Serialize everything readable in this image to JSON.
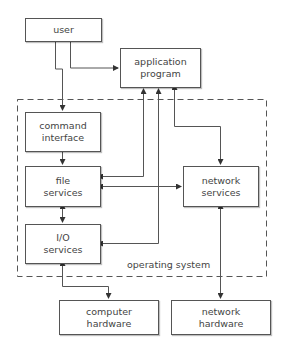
{
  "diagram": {
    "title": "",
    "boundary": {
      "label": "operating system"
    },
    "nodes": [
      {
        "id": "user",
        "label": "user"
      },
      {
        "id": "app",
        "label": "application\nprogram"
      },
      {
        "id": "cmd",
        "label": "command\ninterface"
      },
      {
        "id": "file",
        "label": "file\nservices"
      },
      {
        "id": "io",
        "label": "I/O\nservices"
      },
      {
        "id": "netsvc",
        "label": "network\nservices"
      },
      {
        "id": "comphw",
        "label": "computer\nhardware"
      },
      {
        "id": "nethw",
        "label": "network\nhardware"
      }
    ],
    "edges": [
      {
        "from": "user",
        "to": "app",
        "direction": "one-way"
      },
      {
        "from": "user",
        "to": "cmd",
        "direction": "one-way"
      },
      {
        "from": "cmd",
        "to": "file",
        "direction": "one-way"
      },
      {
        "from": "file",
        "to": "app",
        "direction": "two-way"
      },
      {
        "from": "io",
        "to": "app",
        "direction": "two-way"
      },
      {
        "from": "netsvc",
        "to": "app",
        "direction": "two-way"
      },
      {
        "from": "file",
        "to": "netsvc",
        "direction": "two-way"
      },
      {
        "from": "file",
        "to": "io",
        "direction": "two-way"
      },
      {
        "from": "io",
        "to": "comphw",
        "direction": "two-way"
      },
      {
        "from": "netsvc",
        "to": "nethw",
        "direction": "two-way"
      }
    ],
    "colors": {
      "line": "#555555",
      "text": "#444444",
      "background": "#ffffff"
    }
  }
}
